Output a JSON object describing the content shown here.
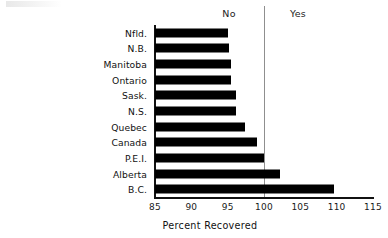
{
  "chart_data": {
    "type": "bar",
    "orientation": "horizontal",
    "title": "",
    "xlabel": "Percent Recovered",
    "ylabel": "",
    "xlim": [
      85,
      115
    ],
    "xticks": [
      85,
      90,
      95,
      100,
      105,
      110,
      115
    ],
    "xtick_labels": [
      "85",
      "90",
      "95",
      "100",
      "105",
      "110",
      "115"
    ],
    "grid": false,
    "legend": "none",
    "bar_color": "#000000",
    "reference_line": {
      "value": 100,
      "color": "#8f8f8f",
      "left_label": "No",
      "right_label": "Yes"
    },
    "categories": [
      "Nfld.",
      "N.B.",
      "Manitoba",
      "Ontario",
      "Sask.",
      "N.S.",
      "Quebec",
      "Canada",
      "P.E.I.",
      "Alberta",
      "B.C."
    ],
    "values": [
      95.1,
      95.2,
      95.5,
      95.4,
      96.2,
      96.2,
      97.4,
      99.0,
      100.0,
      102.2,
      109.6
    ]
  },
  "annotations": {
    "no_label": "No",
    "yes_label": "Yes"
  },
  "axis": {
    "x_title": "Percent Recovered"
  }
}
